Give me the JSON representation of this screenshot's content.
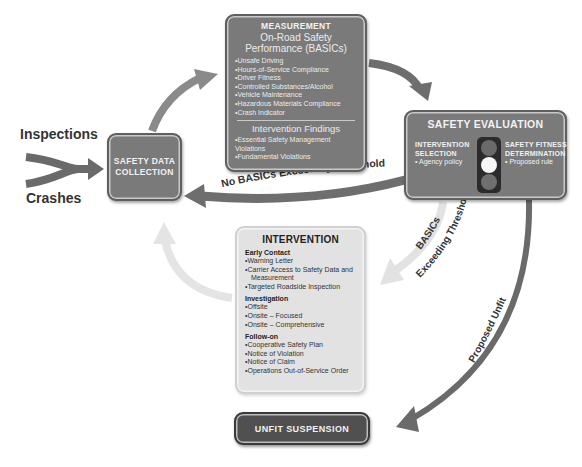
{
  "inputs": {
    "inspections": "Inspections",
    "crashes": "Crashes"
  },
  "nodes": {
    "collection": {
      "line1": "SAFETY DATA",
      "line2": "COLLECTION"
    },
    "measurement": {
      "title": "MEASUREMENT",
      "subtitle": "On-Road Safety Performance (BASICs)",
      "basics": [
        "Unsafe Driving",
        "Hours-of-Service Compliance",
        "Driver Fitness",
        "Controlled Substances/Alcohol",
        "Vehicle Maintenance",
        "Hazardous Materials Compliance",
        "Crash Indicator"
      ],
      "findings_title": "Intervention Findings",
      "findings": [
        "Essential Safety Management Violations",
        "Fundamental Violations"
      ]
    },
    "evaluation": {
      "title": "SAFETY EVALUATION",
      "left_heading_1": "INTERVENTION",
      "left_heading_2": "SELECTION",
      "left_item": "Agency policy",
      "right_heading_1": "SAFETY FITNESS",
      "right_heading_2": "DETERMINATION",
      "right_item": "Proposed rule",
      "traffic_light": {
        "active": "middle",
        "colors": {
          "top": "#6a6a6a",
          "middle": "#f7f7f7",
          "bottom": "#6f6f6f"
        }
      }
    },
    "intervention": {
      "title": "INTERVENTION",
      "sections": [
        {
          "heading": "Early Contact",
          "items": [
            "Warning Letter",
            "Carrier Access to Safety Data and Measurement",
            "Targeted Roadside Inspection"
          ]
        },
        {
          "heading": "Investigation",
          "items": [
            "Offsite",
            "Onsite – Focused",
            "Onsite – Comprehensive"
          ]
        },
        {
          "heading": "Follow-on",
          "items": [
            "Cooperative Safety Plan",
            "Notice of Violation",
            "Notice of Claim",
            "Operations Out-of-Service Order"
          ]
        }
      ]
    },
    "unfit": {
      "label": "UNFIT SUSPENSION"
    }
  },
  "edges": {
    "no_basics": "No BASICs Exceeding Threshold",
    "basics_exceeding_1": "BASICs",
    "basics_exceeding_2": "Exceeding Threshold",
    "proposed_unfit": "Proposed Unfit"
  },
  "colors": {
    "dark_box": "#7a7a7a",
    "darker_box": "#505050",
    "light_box": "#e2e2e2",
    "arrow_dark": "#6e6e6e",
    "arrow_light": "#e0e0e0",
    "text_dark": "#333333"
  }
}
